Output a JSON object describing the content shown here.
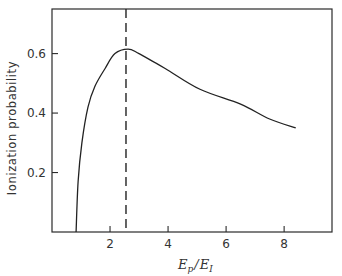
{
  "chart_data": {
    "type": "line",
    "title": "",
    "xlabel": "E_p / E_I",
    "xlabel_parts": {
      "main1": "E",
      "sub1": "p",
      "slash": "/",
      "main2": "E",
      "sub2": "I"
    },
    "ylabel": "Ionization probability",
    "xlim": [
      0,
      9.65
    ],
    "ylim": [
      0,
      0.75
    ],
    "x_ticks": [
      2,
      4,
      6,
      8
    ],
    "x_tick_labels": [
      "2",
      "4",
      "6",
      "8"
    ],
    "y_ticks": [
      0.2,
      0.4,
      0.6
    ],
    "y_tick_labels": [
      "0.2",
      "0.4",
      "0.6"
    ],
    "grid": false,
    "legend": null,
    "series": [
      {
        "name": "Ionization probability",
        "x": [
          0.83,
          0.9,
          1.03,
          1.24,
          1.48,
          1.83,
          2.17,
          2.62,
          3.0,
          3.9,
          5.1,
          6.5,
          7.5,
          8.4
        ],
        "y": [
          0.0,
          0.17,
          0.3,
          0.42,
          0.49,
          0.55,
          0.6,
          0.615,
          0.6,
          0.55,
          0.48,
          0.43,
          0.38,
          0.35
        ]
      }
    ],
    "annotations": [
      {
        "type": "vertical_dashed_line",
        "x": 2.55,
        "description": "maximum of ionization probability"
      }
    ]
  }
}
